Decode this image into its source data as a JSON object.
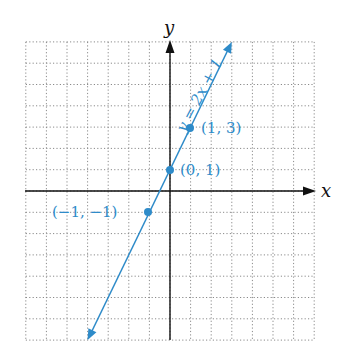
{
  "chart_data": {
    "type": "line",
    "title": "",
    "xlabel": "x",
    "ylabel": "y",
    "xlim": [
      -7,
      7
    ],
    "ylim": [
      -7,
      7
    ],
    "grid": true,
    "grid_style": "dotted",
    "series": [
      {
        "name": "y = 2x + 1",
        "equation": "y = 2x + 1",
        "color": "#2e8bc9",
        "x": [
          -4,
          3
        ],
        "y": [
          -7,
          7
        ],
        "arrows_both_ends": true
      }
    ],
    "points": [
      {
        "x": -1,
        "y": -1,
        "label": "(−1, −1)"
      },
      {
        "x": 0,
        "y": 1,
        "label": "(0, 1)"
      },
      {
        "x": 1,
        "y": 3,
        "label": "(1, 3)"
      }
    ]
  },
  "labels": {
    "x_axis": "x",
    "y_axis": "y",
    "equation": "y = 2x + 1",
    "p1": "(−1, −1)",
    "p2": "(0, 1)",
    "p3": "(1, 3)"
  }
}
